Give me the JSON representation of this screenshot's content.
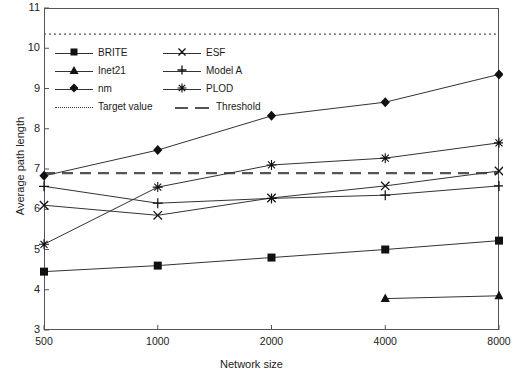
{
  "chart_data": {
    "type": "line",
    "title": "",
    "xlabel": "Network size",
    "ylabel": "Average path length",
    "categories": [
      "500",
      "1000",
      "2000",
      "4000",
      "8000"
    ],
    "x_tick_labels": [
      "500",
      "1000",
      "2000",
      "4000",
      "8000"
    ],
    "y_tick_labels": [
      "3",
      "4",
      "5",
      "6",
      "7",
      "8",
      "9",
      "10",
      "11"
    ],
    "y_ticks": [
      3,
      4,
      5,
      6,
      7,
      8,
      9,
      10,
      11
    ],
    "ylim": [
      3,
      11
    ],
    "grid": false,
    "legend_position": "upper-left-inside",
    "series": [
      {
        "name": "BRITE",
        "marker": "filled-square",
        "values": [
          4.45,
          4.6,
          4.8,
          5.0,
          5.22
        ]
      },
      {
        "name": "ESF",
        "marker": "x-cross",
        "values": [
          6.1,
          5.85,
          6.28,
          6.58,
          6.95
        ]
      },
      {
        "name": "Inet21",
        "marker": "filled-triangle",
        "values": [
          null,
          null,
          null,
          3.78,
          3.85
        ]
      },
      {
        "name": "Model A",
        "marker": "plus",
        "values": [
          6.57,
          6.15,
          6.27,
          6.35,
          6.58
        ]
      },
      {
        "name": "nm",
        "marker": "filled-diamond",
        "values": [
          6.83,
          7.47,
          8.32,
          8.66,
          9.35
        ]
      },
      {
        "name": "PLOD",
        "marker": "asterisk",
        "values": [
          5.13,
          6.55,
          7.1,
          7.27,
          7.65
        ]
      }
    ],
    "reference_lines": [
      {
        "name": "Target value",
        "value": 10.35,
        "style": "dotted"
      },
      {
        "name": "Threshold",
        "value": 6.9,
        "style": "dashed"
      }
    ],
    "axis_color": "#555555",
    "line_color": "#333333"
  },
  "legend": {
    "rows": [
      {
        "left": "BRITE",
        "right": "ESF"
      },
      {
        "left": "Inet21",
        "right": "Model A"
      },
      {
        "left": "nm",
        "right": "PLOD"
      }
    ],
    "ref_row": {
      "left": "Target value",
      "right": "Threshold"
    }
  }
}
